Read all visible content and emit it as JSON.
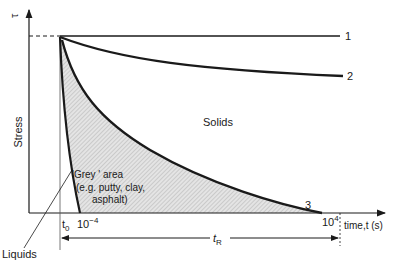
{
  "diagram": {
    "y_axis": {
      "label": "Stress",
      "symbol": "τ"
    },
    "x_axis": {
      "label": "time,t (s)"
    },
    "ticks": {
      "t0": "t",
      "t0_sub": "0",
      "t_low": "10",
      "t_low_exp": "−4",
      "t_high": "10",
      "t_high_exp": "4"
    },
    "curves": [
      {
        "id": "1",
        "label": "1",
        "description": "constant stress (ideal solid)"
      },
      {
        "id": "2",
        "label": "2",
        "description": "slow relaxation (solid)"
      },
      {
        "id": "3",
        "label": "3",
        "description": "relaxation within grey area"
      }
    ],
    "regions": {
      "solids": "Solids",
      "grey_line1": "'Grey ' area",
      "grey_line2": "(e.g. putty, clay,",
      "grey_line3": "asphalt)",
      "liquids": "Liquids"
    },
    "relaxation_time": {
      "label": "t",
      "sub": "R"
    },
    "colors": {
      "line": "#1a1a1a",
      "hatch": "#c8c8c8",
      "background": "#ffffff"
    }
  }
}
